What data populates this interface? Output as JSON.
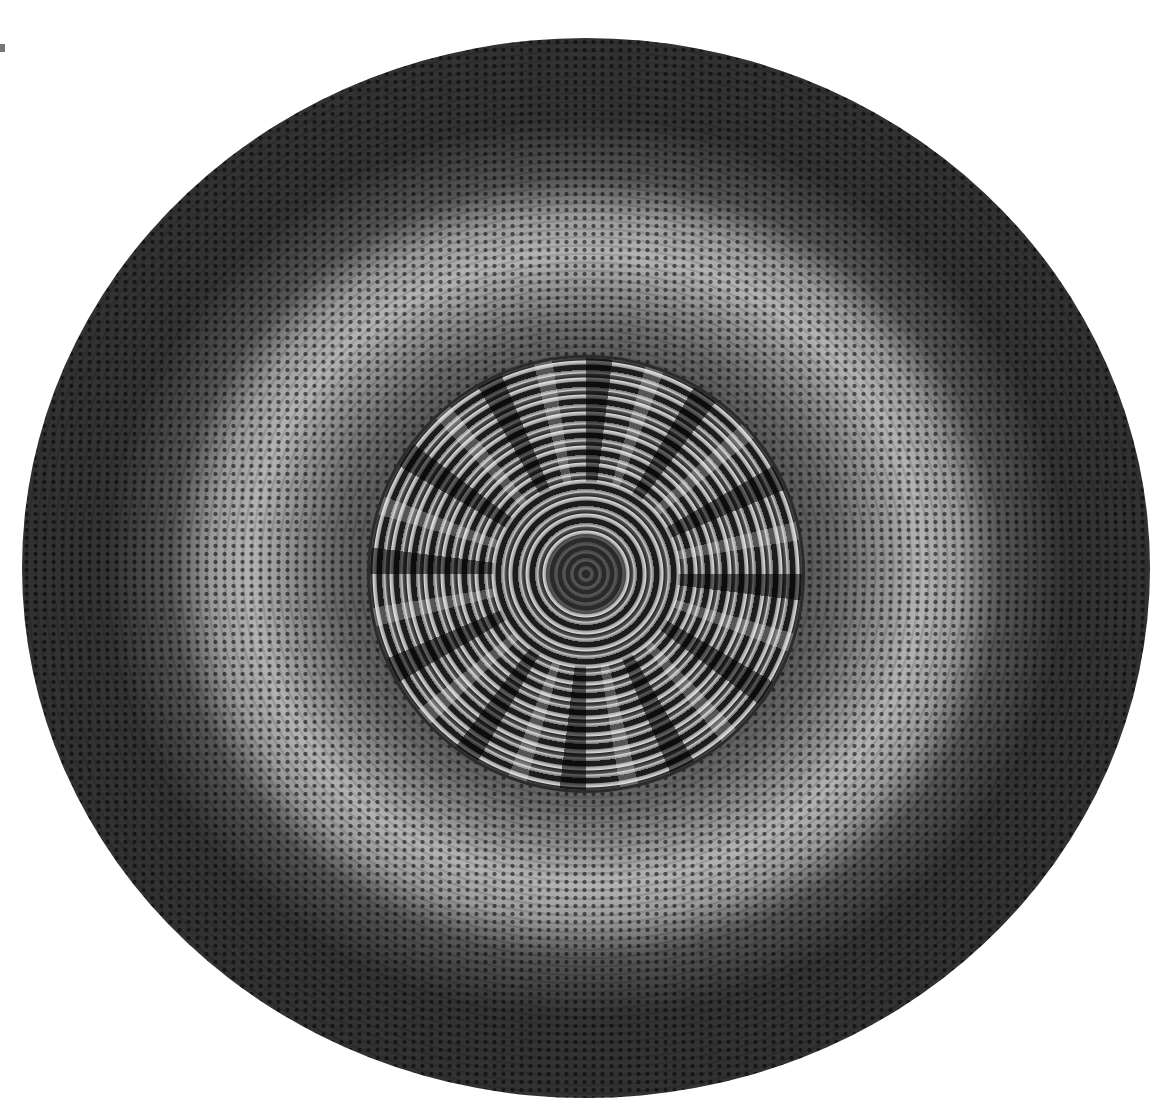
{
  "image": {
    "subject": "Round braided rug",
    "style": "black-and-white photograph",
    "background_color": "#ffffff",
    "bands": [
      {
        "name": "outer-band",
        "tone": "dark",
        "color": "#2e2e2e"
      },
      {
        "name": "light-band",
        "tone": "light",
        "color": "#b3b3b3"
      },
      {
        "name": "middle-band",
        "tone": "medium-dark",
        "color": "#5a5a5a"
      },
      {
        "name": "center-medallion",
        "tone": "coiled multicolor strips",
        "color": "#1c1c1c"
      }
    ]
  }
}
